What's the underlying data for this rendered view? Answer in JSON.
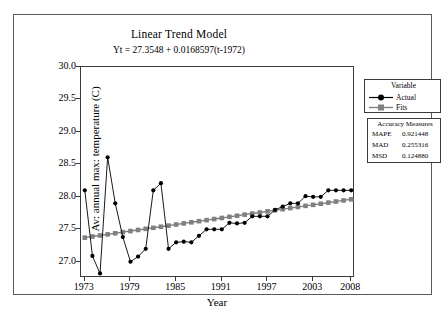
{
  "chart_data": {
    "type": "line",
    "title": "Linear Trend Model",
    "subtitle": "Yt = 27.3548 + 0.0168597(t-1972)",
    "xlabel": "Year",
    "ylabel": "Av: annual max: temperature (C)",
    "xlim": [
      1972.5,
      2008.5
    ],
    "ylim": [
      26.75,
      30.0
    ],
    "grid": false,
    "legend_position": "right",
    "x_ticks": [
      "1973",
      "1979",
      "1985",
      "1991",
      "1997",
      "2003",
      "2008"
    ],
    "x_tick_values": [
      1973,
      1979,
      1985,
      1991,
      1997,
      2003,
      2008
    ],
    "y_ticks": [
      "27.0",
      "27.5",
      "28.0",
      "28.5",
      "29.0",
      "29.5",
      "30.0"
    ],
    "y_tick_values": [
      27.0,
      27.5,
      28.0,
      28.5,
      29.0,
      29.5,
      30.0
    ],
    "x": [
      1973,
      1974,
      1975,
      1976,
      1977,
      1978,
      1979,
      1980,
      1981,
      1982,
      1983,
      1984,
      1985,
      1986,
      1987,
      1988,
      1989,
      1990,
      1991,
      1992,
      1993,
      1994,
      1995,
      1996,
      1997,
      1998,
      1999,
      2000,
      2001,
      2002,
      2003,
      2004,
      2005,
      2006,
      2007,
      2008
    ],
    "series": [
      {
        "name": "Actual",
        "marker": "circle",
        "color": "#000000",
        "values": [
          28.1,
          27.09,
          26.82,
          28.61,
          27.9,
          27.38,
          27.0,
          27.08,
          27.2,
          28.1,
          28.21,
          27.2,
          27.3,
          27.31,
          27.3,
          27.4,
          27.5,
          27.5,
          27.5,
          27.6,
          27.59,
          27.6,
          27.7,
          27.7,
          27.7,
          27.8,
          27.85,
          27.9,
          27.9,
          28.01,
          28.0,
          28.0,
          28.1,
          28.1,
          28.1,
          28.1
        ]
      },
      {
        "name": "Fits",
        "marker": "square",
        "color": "#808080",
        "values": [
          27.372,
          27.389,
          27.405,
          27.422,
          27.439,
          27.456,
          27.473,
          27.49,
          27.507,
          27.523,
          27.54,
          27.557,
          27.574,
          27.591,
          27.608,
          27.625,
          27.641,
          27.658,
          27.675,
          27.692,
          27.709,
          27.726,
          27.743,
          27.759,
          27.776,
          27.793,
          27.81,
          27.827,
          27.844,
          27.861,
          27.877,
          27.894,
          27.911,
          27.928,
          27.945,
          27.962
        ]
      }
    ]
  },
  "legend": {
    "title": "Variable",
    "entries": [
      {
        "label": "Actual"
      },
      {
        "label": "Fits"
      }
    ]
  },
  "accuracy": {
    "title": "Accuracy Measures",
    "rows": [
      {
        "name": "MAPE",
        "value": "0.921448"
      },
      {
        "name": "MAD",
        "value": "0.255316"
      },
      {
        "name": "MSD",
        "value": "0.124880"
      }
    ]
  },
  "colors": {
    "actual": "#000000",
    "fits": "#808080",
    "axis": "#3a3a3a",
    "frame": "#5a5a5a",
    "background": "#ffffff"
  }
}
